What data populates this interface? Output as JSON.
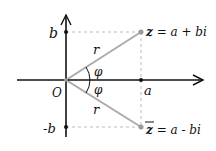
{
  "diagram": {
    "labels": {
      "b": "b",
      "neg_b": "-b",
      "origin": "O",
      "a": "a",
      "r_top": "r",
      "r_bottom": "r",
      "phi_top": "φ",
      "phi_bottom": "φ",
      "z": "z = a + bi",
      "z_conj_letter": "z",
      "z_conj_rest": " = a - bi",
      "z_letter": "z",
      "z_rest": " = a + bi"
    },
    "colors": {
      "axis": "#111111",
      "vector": "#aaaaaa",
      "dashed": "#bbbbbb",
      "point": "#999999"
    }
  }
}
